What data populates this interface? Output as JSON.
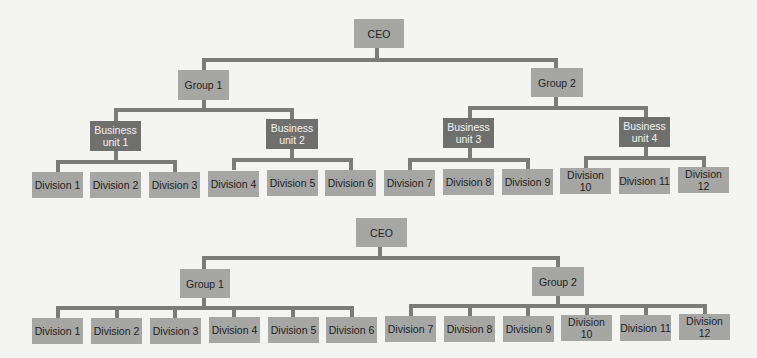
{
  "colors": {
    "background": "#f4f4f3",
    "box_light": "#a6a6a5",
    "box_dark": "#6f6f6e",
    "connector": "#7b7b7a",
    "text_dark": "#1e1e1e",
    "text_light": "#f2f2f2"
  },
  "chart_top": {
    "ceo": "CEO",
    "groups": [
      {
        "label": "Group 1",
        "business_units": [
          {
            "label": "Business unit 1",
            "divisions": [
              "Division 1",
              "Division 2",
              "Division 3"
            ]
          },
          {
            "label": "Business unit 2",
            "divisions": [
              "Division 4",
              "Division 5",
              "Division 6"
            ]
          }
        ]
      },
      {
        "label": "Group 2",
        "business_units": [
          {
            "label": "Business unit 3",
            "divisions": [
              "Division 7",
              "Division 8",
              "Division 9"
            ]
          },
          {
            "label": "Business unit 4",
            "divisions": [
              "Division 10",
              "Division 11",
              "Division 12"
            ]
          }
        ]
      }
    ]
  },
  "chart_bottom": {
    "ceo": "CEO",
    "groups": [
      {
        "label": "Group 1",
        "divisions": [
          "Division 1",
          "Division 2",
          "Division 3",
          "Division 4",
          "Division 5",
          "Division 6"
        ]
      },
      {
        "label": "Group 2",
        "divisions": [
          "Division 7",
          "Division 8",
          "Division 9",
          "Division 10",
          "Division 11",
          "Division 12"
        ]
      }
    ]
  }
}
